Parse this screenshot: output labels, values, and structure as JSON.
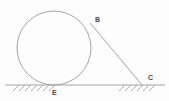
{
  "figure": {
    "background_color": "#fdfdfd",
    "stroke_color": "#9a9a9a",
    "label_color": "#4a4a4a",
    "canvas": {
      "width": 169,
      "height": 101
    }
  },
  "circle": {
    "name": "circle",
    "cx": 54,
    "cy": 48,
    "r": 37,
    "stroke_width": 0.9
  },
  "ground_line": {
    "name": "ground-line",
    "x1": 5,
    "y1": 85,
    "x2": 165,
    "y2": 85,
    "stroke_width": 0.9
  },
  "tangent_line": {
    "name": "tangent-segment-BC",
    "x1": 90.5,
    "y1": 23.5,
    "x2": 142,
    "y2": 85,
    "stroke_width": 0.9
  },
  "hatching": {
    "stroke_width": 0.8,
    "groups": [
      {
        "name": "hatch-group-left",
        "x_start": 13,
        "x_end": 49,
        "count": 7,
        "spacing": 6,
        "dx": 6,
        "dy": 6
      },
      {
        "name": "hatch-group-right",
        "x_start": 119,
        "x_end": 149,
        "count": 6,
        "spacing": 6,
        "dx": 6,
        "dy": 6
      }
    ]
  },
  "labels": [
    {
      "id": "B",
      "text": "B",
      "x": 95,
      "y": 16
    },
    {
      "id": "C",
      "text": "C",
      "x": 148,
      "y": 74
    },
    {
      "id": "E",
      "text": "E",
      "x": 52,
      "y": 89
    }
  ]
}
